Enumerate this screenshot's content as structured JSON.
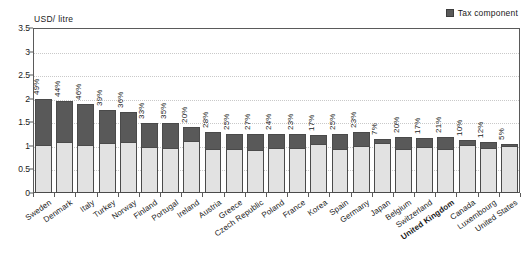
{
  "legend": {
    "label": "Tax component",
    "swatch_color": "#595959",
    "position": "top-right"
  },
  "axis": {
    "y_title": "USD/ litre",
    "y_ticks": [
      "0",
      "0.5",
      "1",
      "1.5",
      "2",
      "2.5",
      "3",
      "3.5"
    ],
    "y_min": 0,
    "y_max": 3.5
  },
  "colors": {
    "tax_component": "#595959",
    "base_price": "#e2e2e2",
    "bar_outline": "#4a4a4a",
    "frame": "#5a5a5a",
    "gridline": "#c9c9c9",
    "background": "#ffffff"
  },
  "top_artifact": {
    "text": ""
  },
  "chart_data": {
    "type": "bar",
    "title": "",
    "subtitle": "",
    "xlabel": "",
    "ylabel": "USD/ litre",
    "ylim": [
      0,
      3.5
    ],
    "yticks": [
      0,
      0.5,
      1,
      1.5,
      2,
      2.5,
      3,
      3.5
    ],
    "grid": true,
    "stacked": true,
    "legend_entries": [
      "Tax component"
    ],
    "legend_position": "top-right",
    "bold_categories": [
      "United Kingdom"
    ],
    "categories": [
      "Sweden",
      "Denmark",
      "Italy",
      "Turkey",
      "Norway",
      "Finland",
      "Portugal",
      "Ireland",
      "Austria",
      "Greece",
      "Czech Republic",
      "Poland",
      "France",
      "Korea",
      "Spain",
      "Germany",
      "Japan",
      "Belgium",
      "Switzerland",
      "United Kingdom",
      "Canada",
      "Luxembourg",
      "United States"
    ],
    "series": [
      {
        "name": "Base price",
        "values": [
          1.02,
          1.09,
          1.01,
          1.07,
          1.08,
          0.97,
          0.96,
          1.11,
          0.93,
          0.94,
          0.91,
          0.96,
          0.96,
          1.03,
          0.94,
          1.0,
          1.07,
          0.94,
          0.97,
          0.94,
          1.01,
          0.96,
          0.99
        ]
      },
      {
        "name": "Tax component",
        "values": [
          0.98,
          0.86,
          0.88,
          0.69,
          0.64,
          0.51,
          0.52,
          0.29,
          0.36,
          0.31,
          0.34,
          0.3,
          0.29,
          0.21,
          0.31,
          0.3,
          0.08,
          0.24,
          0.2,
          0.25,
          0.11,
          0.13,
          0.05
        ]
      }
    ],
    "totals": [
      2.0,
      1.95,
      1.89,
      1.76,
      1.72,
      1.48,
      1.48,
      1.4,
      1.29,
      1.25,
      1.25,
      1.26,
      1.25,
      1.24,
      1.25,
      1.3,
      1.15,
      1.18,
      1.17,
      1.19,
      1.12,
      1.09,
      1.04
    ],
    "data_labels": [
      "49%",
      "44%",
      "46%",
      "39%",
      "36%",
      "33%",
      "35%",
      "20%",
      "28%",
      "25%",
      "27%",
      "24%",
      "23%",
      "17%",
      "25%",
      "23%",
      "7%",
      "20%",
      "17%",
      "21%",
      "10%",
      "12%",
      "5%"
    ],
    "data_label_meaning": "Tax component share of total price"
  }
}
